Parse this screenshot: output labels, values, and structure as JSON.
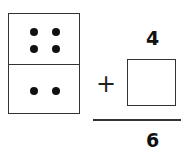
{
  "problem": {
    "domino": {
      "top_dots": 4,
      "bottom_dots": 2
    },
    "addend": "4",
    "operator": "+",
    "answer_box": "",
    "sum": "6"
  }
}
